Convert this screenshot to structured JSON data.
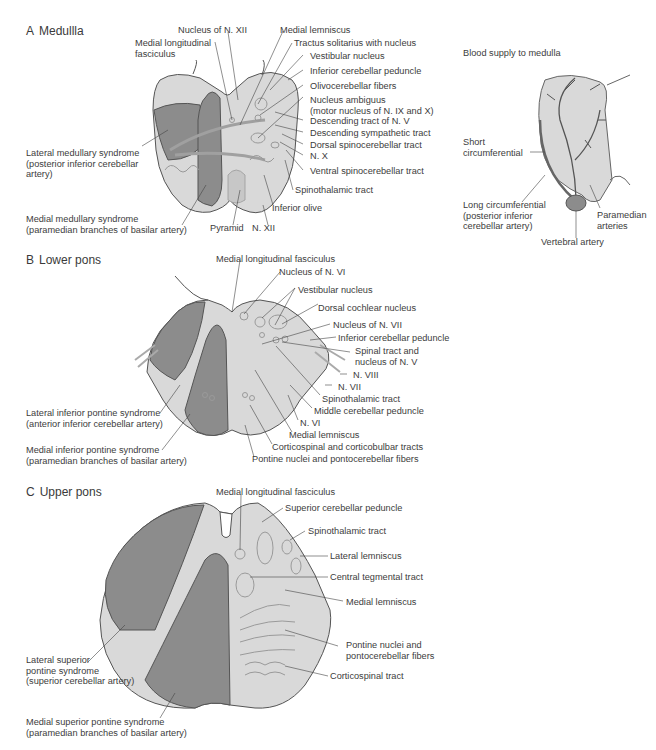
{
  "colors": {
    "tissue_light": "#d9d9d9",
    "tissue_mid": "#c7c7c7",
    "lesion_dark": "#8c8c8c",
    "outline": "#555555",
    "structure_line": "#9a9a9a",
    "text": "#3c3c3c"
  },
  "sections": {
    "A": {
      "letter": "A",
      "title": "Medullla",
      "labels": {
        "nucleus_xii": "Nucleus of N. XII",
        "medial_lemniscus": "Medial lemniscus",
        "mlf": "Medial longitudinal\nfasciculus",
        "tractus_solitarius": "Tractus solitarius with nucleus",
        "vestibular": "Vestibular nucleus",
        "inf_cerebellar_peduncle": "Inferior cerebellar peduncle",
        "olivocerebellar": "Olivocerebellar fibers",
        "nucleus_ambiguus": "Nucleus ambiguus\n(motor nucleus of N. IX and X)",
        "desc_tract_v": "Descending tract of N. V",
        "desc_sympathetic": "Descending sympathetic tract",
        "dorsal_spinocerebellar": "Dorsal spinocerebellar tract",
        "n_x": "N. X",
        "ventral_spinocerebellar": "Ventral spinocerebellar tract",
        "spinothalamic": "Spinothalamic tract",
        "inferior_olive": "Inferior olive",
        "pyramid": "Pyramid",
        "n_xii": "N. XII",
        "lateral_syndrome": "Lateral medullary syndrome\n(posterior inferior cerebellar\nartery)",
        "medial_syndrome": "Medial medullary syndrome\n(paramedian branches of basilar artery)"
      }
    },
    "blood_supply": {
      "title": "Blood supply to medulla",
      "labels": {
        "short_circ": "Short\ncircumferential",
        "long_circ": "Long circumferential\n(posterior inferior\ncerebellar artery)",
        "paramedian": "Paramedian\narteries",
        "vertebral": "Vertebral artery"
      }
    },
    "B": {
      "letter": "B",
      "title": "Lower pons",
      "labels": {
        "mlf": "Medial longitudinal fasciculus",
        "nucleus_vi": "Nucleus of N. VI",
        "vestibular": "Vestibular nucleus",
        "dorsal_cochlear": "Dorsal cochlear nucleus",
        "nucleus_vii": "Nucleus of N. VII",
        "inf_cerebellar_peduncle": "Inferior cerebellar peduncle",
        "spinal_tract_v": "Spinal tract and\nnucleus of N. V",
        "n_viii": "N. VIII",
        "n_vii": "N. VII",
        "spinothalamic": "Spinothalamic tract",
        "middle_cerebellar_peduncle": "Middle cerebellar peduncle",
        "n_vi": "N. VI",
        "medial_lemniscus": "Medial lemniscus",
        "corticospinal": "Corticospinal and corticobulbar tracts",
        "pontine_nuclei": "Pontine nuclei and pontocerebellar fibers",
        "lateral_syndrome": "Lateral inferior pontine syndrome\n(anterior inferior cerebellar artery)",
        "medial_syndrome": "Medial inferior pontine syndrome\n(paramedian branches of basilar artery)"
      }
    },
    "C": {
      "letter": "C",
      "title": "Upper pons",
      "labels": {
        "mlf": "Medial longitudinal fasciculus",
        "superior_cerebellar_peduncle": "Superior cerebellar peduncle",
        "spinothalamic": "Spinothalamic tract",
        "lateral_lemniscus": "Lateral lemniscus",
        "central_tegmental": "Central tegmental tract",
        "medial_lemniscus": "Medial lemniscus",
        "pontine_nuclei": "Pontine nuclei and\npontocerebellar fibers",
        "corticospinal": "Corticospinal tract",
        "lateral_syndrome": "Lateral superior\npontine syndrome\n(superior cerebellar artery)",
        "medial_syndrome": "Medial superior pontine syndrome\n(paramedian branches of basilar artery)"
      }
    }
  }
}
